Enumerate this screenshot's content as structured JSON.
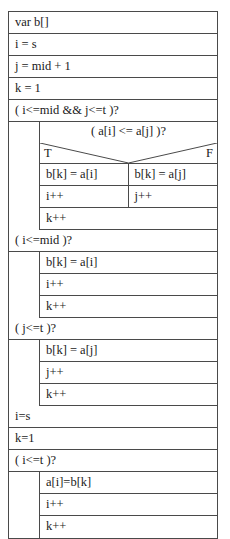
{
  "diagram": {
    "type": "nassi-shneiderman-structogram",
    "blocks": [
      {
        "kind": "statement",
        "text": "var b[]"
      },
      {
        "kind": "statement",
        "text": "i = s"
      },
      {
        "kind": "statement",
        "text": "j = mid + 1"
      },
      {
        "kind": "statement",
        "text": "k = 1"
      },
      {
        "kind": "loop",
        "condition": "( i<=mid && j<=t )?",
        "decision": {
          "question": "( a[i] <= a[j] )?",
          "true_label": "T",
          "false_label": "F",
          "true_branch": [
            "b[k] = a[i]",
            "i++"
          ],
          "false_branch": [
            "b[k] = a[j]",
            "j++"
          ]
        },
        "after_decision": [
          "k++"
        ]
      },
      {
        "kind": "loop",
        "condition": "( i<=mid )?",
        "body": [
          "b[k] = a[i]",
          "i++",
          "k++"
        ]
      },
      {
        "kind": "loop",
        "condition": "( j<=t )?",
        "body": [
          "b[k] = a[j]",
          "j++",
          "k++"
        ]
      },
      {
        "kind": "statement",
        "text": "i=s"
      },
      {
        "kind": "statement",
        "text": "k=1"
      },
      {
        "kind": "loop",
        "condition": "( i<=t )?",
        "body": [
          "a[i]=b[k]",
          "i++",
          "k++"
        ]
      }
    ]
  },
  "colors": {
    "border": "#4a4a4a",
    "background": "#ffffff",
    "text": "#1a1a1a"
  }
}
